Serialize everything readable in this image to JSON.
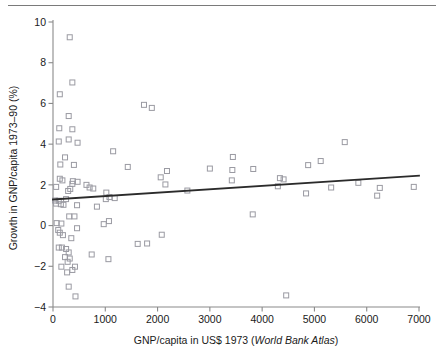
{
  "figure": {
    "name": "gnp-growth-scatter",
    "has_top_rule": true,
    "marker_color": "#9a9aa2",
    "trend_color": "#2b2b2b",
    "axis_color": "#8a8a8a"
  },
  "chart_data": {
    "type": "scatter",
    "title": "",
    "xlabel_plain": "GNP/capita in US$ 1973 (",
    "xlabel_italic": "World Bank Atlas",
    "xlabel_close": ")",
    "xlabel": "GNP/capita in US$ 1973 (World Bank Atlas)",
    "ylabel": "Growth in GNP/capita 1973–90 (%)",
    "xlim": [
      0,
      7000
    ],
    "ylim": [
      -4,
      10
    ],
    "xticks": [
      0,
      1000,
      2000,
      3000,
      4000,
      5000,
      6000,
      7000
    ],
    "xticklabels": [
      "0",
      "1000",
      "2000",
      "3000",
      "4000",
      "5000",
      "6000",
      "7000"
    ],
    "yticks": [
      -4,
      -2,
      0,
      2,
      4,
      6,
      8,
      10
    ],
    "yticklabels": [
      "−4",
      "−2",
      "0",
      "2",
      "4",
      "6",
      "8",
      "10"
    ],
    "grid": false,
    "legend": null,
    "marker_style": "open-square",
    "trendline": {
      "type": "linear-fit",
      "x": [
        0,
        7000
      ],
      "y": [
        1.28,
        2.45
      ],
      "slope_per_1000": 0.167,
      "intercept": 1.28
    },
    "points": [
      [
        320,
        9.25
      ],
      [
        370,
        7.03
      ],
      [
        130,
        6.45
      ],
      [
        1740,
        5.93
      ],
      [
        1890,
        5.78
      ],
      [
        300,
        5.38
      ],
      [
        120,
        4.78
      ],
      [
        370,
        4.73
      ],
      [
        300,
        4.23
      ],
      [
        110,
        4.13
      ],
      [
        470,
        4.07
      ],
      [
        5580,
        4.1
      ],
      [
        1150,
        3.65
      ],
      [
        3440,
        3.37
      ],
      [
        230,
        3.35
      ],
      [
        5120,
        3.17
      ],
      [
        140,
        3.0
      ],
      [
        400,
        2.98
      ],
      [
        4880,
        2.97
      ],
      [
        1430,
        2.88
      ],
      [
        3000,
        2.8
      ],
      [
        3830,
        2.78
      ],
      [
        3430,
        2.73
      ],
      [
        2180,
        2.68
      ],
      [
        2060,
        2.37
      ],
      [
        130,
        2.3
      ],
      [
        180,
        2.22
      ],
      [
        3420,
        2.22
      ],
      [
        4340,
        2.33
      ],
      [
        4410,
        2.27
      ],
      [
        380,
        2.18
      ],
      [
        470,
        2.15
      ],
      [
        370,
        2.05
      ],
      [
        2150,
        2.02
      ],
      [
        640,
        2.0
      ],
      [
        5840,
        2.1
      ],
      [
        6900,
        1.9
      ],
      [
        60,
        1.9
      ],
      [
        4300,
        1.93
      ],
      [
        700,
        1.87
      ],
      [
        5320,
        1.87
      ],
      [
        6250,
        1.85
      ],
      [
        330,
        1.8
      ],
      [
        770,
        1.82
      ],
      [
        2570,
        1.72
      ],
      [
        290,
        1.7
      ],
      [
        1020,
        1.62
      ],
      [
        4840,
        1.58
      ],
      [
        6200,
        1.47
      ],
      [
        1080,
        1.4
      ],
      [
        1180,
        1.35
      ],
      [
        1010,
        1.3
      ],
      [
        40,
        1.23
      ],
      [
        110,
        1.22
      ],
      [
        250,
        1.3
      ],
      [
        60,
        1.08
      ],
      [
        150,
        1.05
      ],
      [
        200,
        1.02
      ],
      [
        460,
        1.0
      ],
      [
        840,
        0.93
      ],
      [
        3820,
        0.55
      ],
      [
        310,
        0.45
      ],
      [
        410,
        0.45
      ],
      [
        1070,
        0.22
      ],
      [
        70,
        0.12
      ],
      [
        160,
        0.1
      ],
      [
        970,
        0.07
      ],
      [
        460,
        -0.13
      ],
      [
        100,
        -0.22
      ],
      [
        130,
        -0.35
      ],
      [
        190,
        -0.47
      ],
      [
        2080,
        -0.45
      ],
      [
        350,
        -0.62
      ],
      [
        1620,
        -0.9
      ],
      [
        1800,
        -0.88
      ],
      [
        110,
        -1.08
      ],
      [
        170,
        -1.08
      ],
      [
        250,
        -1.15
      ],
      [
        300,
        -1.32
      ],
      [
        740,
        -1.42
      ],
      [
        230,
        -1.55
      ],
      [
        320,
        -1.62
      ],
      [
        1060,
        -1.65
      ],
      [
        280,
        -1.78
      ],
      [
        160,
        -2.02
      ],
      [
        420,
        -2.02
      ],
      [
        370,
        -2.18
      ],
      [
        270,
        -2.3
      ],
      [
        300,
        -3.0
      ],
      [
        430,
        -3.48
      ],
      [
        4460,
        -3.43
      ]
    ],
    "n_points": 91
  }
}
